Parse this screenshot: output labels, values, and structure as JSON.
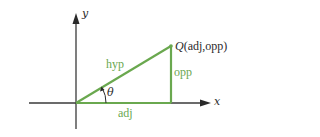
{
  "diagram": {
    "colors": {
      "axis": "#3a3a3a",
      "triangle": "#6aa84f",
      "label_green": "#6aa84f",
      "text_dark": "#2a2a2a"
    },
    "axes": {
      "x_label": "x",
      "y_label": "y"
    },
    "angle_label": "θ",
    "sides": {
      "hypotenuse": "hyp",
      "opposite": "opp",
      "adjacent": "adj"
    },
    "point": {
      "name": "Q",
      "coords": "(adj,opp)"
    }
  }
}
